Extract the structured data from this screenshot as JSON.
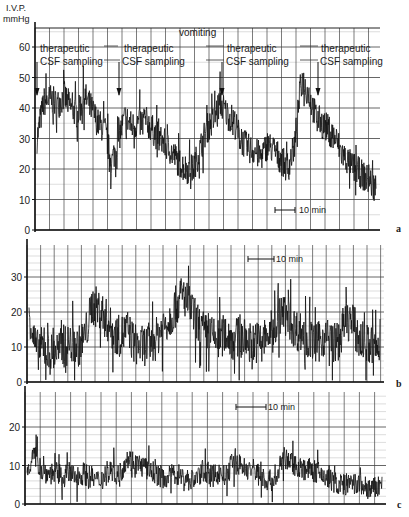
{
  "chart_data": [
    {
      "type": "line",
      "panel": "a",
      "title": "",
      "ylabel": "I.V.P. mmHg",
      "ylabel_line1": "I.V.P.",
      "ylabel_line2": "mmHg",
      "xlabel": "",
      "ylim": [
        0,
        65
      ],
      "yticks": [
        0,
        10,
        20,
        30,
        40,
        50,
        60
      ],
      "scale_bar": "10 min",
      "grid": true,
      "annotations": [
        {
          "text_line1": "therapeutic",
          "text_line2": "CSF sampling",
          "x_frac": 0.02
        },
        {
          "text_line1": "therapeutic",
          "text_line2": "CSF sampling",
          "x_frac": 0.25
        },
        {
          "text": "vomiting",
          "x_frac": 0.48
        },
        {
          "text_line1": "therapeutic",
          "text_line2": "CSF sampling",
          "x_frac": 0.55
        },
        {
          "text_line1": "therapeutic",
          "text_line2": "CSF sampling",
          "x_frac": 0.82
        }
      ],
      "x": [
        0,
        2,
        4,
        6,
        8,
        10,
        12,
        14,
        16,
        18,
        20,
        22,
        24,
        26,
        28,
        30,
        32,
        34,
        36,
        38,
        40,
        42,
        44,
        46,
        48,
        50,
        52,
        54,
        56,
        58,
        60,
        62,
        64,
        66,
        68,
        70,
        72,
        74,
        76,
        78,
        80,
        82,
        84,
        86,
        88,
        90,
        92,
        94,
        96,
        98,
        100
      ],
      "series": [
        {
          "name": "IVP",
          "values": [
            30,
            42,
            43,
            41,
            44,
            40,
            38,
            44,
            40,
            35,
            33,
            22,
            30,
            37,
            34,
            35,
            36,
            33,
            30,
            28,
            25,
            22,
            20,
            20,
            26,
            33,
            36,
            42,
            38,
            36,
            30,
            27,
            26,
            24,
            28,
            26,
            23,
            20,
            28,
            50,
            45,
            38,
            35,
            33,
            30,
            25,
            22,
            20,
            18,
            16,
            14
          ]
        }
      ]
    },
    {
      "type": "line",
      "panel": "b",
      "ylim": [
        0,
        38
      ],
      "yticks": [
        0,
        10,
        20,
        30
      ],
      "scale_bar": "10 min",
      "grid": true,
      "x": [
        0,
        2,
        4,
        6,
        8,
        10,
        12,
        14,
        16,
        18,
        20,
        22,
        24,
        26,
        28,
        30,
        32,
        34,
        36,
        38,
        40,
        42,
        44,
        46,
        48,
        50,
        52,
        54,
        56,
        58,
        60,
        62,
        64,
        66,
        68,
        70,
        72,
        74,
        76,
        78,
        80,
        82,
        84,
        86,
        88,
        90,
        92,
        94,
        96,
        98,
        100
      ],
      "series": [
        {
          "name": "IVP",
          "values": [
            20,
            9,
            10,
            8,
            9,
            10,
            11,
            10,
            13,
            22,
            21,
            18,
            14,
            13,
            15,
            11,
            10,
            11,
            12,
            16,
            18,
            22,
            25,
            21,
            17,
            14,
            13,
            12,
            14,
            12,
            13,
            12,
            11,
            12,
            13,
            16,
            20,
            18,
            15,
            14,
            12,
            11,
            13,
            12,
            11,
            17,
            18,
            12,
            11,
            10,
            9
          ]
        }
      ]
    },
    {
      "type": "line",
      "panel": "c",
      "ylim": [
        0,
        25
      ],
      "yticks": [
        0,
        10,
        20
      ],
      "scale_bar": "10 min",
      "grid": true,
      "x": [
        0,
        2,
        4,
        6,
        8,
        10,
        12,
        14,
        16,
        18,
        20,
        22,
        24,
        26,
        28,
        30,
        32,
        34,
        36,
        38,
        40,
        42,
        44,
        46,
        48,
        50,
        52,
        54,
        56,
        58,
        60,
        62,
        64,
        66,
        68,
        70,
        72,
        74,
        76,
        78,
        80,
        82,
        84,
        86,
        88,
        90,
        92,
        94,
        96,
        98,
        100
      ],
      "series": [
        {
          "name": "IVP",
          "values": [
            9,
            13,
            9,
            8,
            8,
            7,
            8,
            7,
            8,
            7,
            6,
            7,
            9,
            7,
            12,
            11,
            10,
            9,
            8,
            7,
            7,
            8,
            7,
            6,
            7,
            9,
            7,
            8,
            7,
            11,
            10,
            9,
            9,
            7,
            6,
            6,
            12,
            11,
            10,
            9,
            9,
            8,
            7,
            6,
            5,
            5,
            5,
            5,
            4,
            4,
            5
          ]
        }
      ]
    }
  ],
  "figure": {
    "panel_a_letter": "a",
    "panel_b_letter": "b",
    "panel_c_letter": "c",
    "scale_bar_label": "10 min",
    "vomiting_label": "vomiting",
    "annotation_word1": "therapeutic",
    "annotation_word2": "CSF sampling",
    "ylabel_line1": "I.V.P.",
    "ylabel_line2": "mmHg"
  }
}
